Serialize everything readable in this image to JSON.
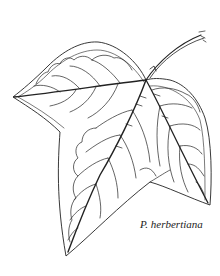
{
  "illustration": {
    "subject": "leaf line drawing",
    "caption": "P. herbertiana",
    "colors": {
      "background": "#ffffff",
      "line": "#222222"
    }
  }
}
